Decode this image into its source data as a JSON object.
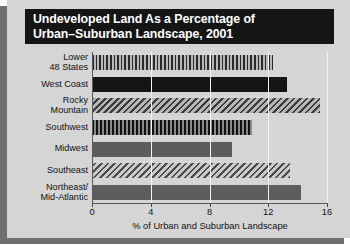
{
  "chart_data": {
    "type": "bar",
    "orientation": "horizontal",
    "title": "Undeveloped Land As a Percentage of Urban–Suburban Landscape, 2001",
    "title_lines": [
      "Undeveloped Land As a Percentage of",
      "Urban–Suburban Landscape, 2001"
    ],
    "categories": [
      "Lower\n48 States",
      "West Coast",
      "Rocky\nMountain",
      "Southwest",
      "Midwest",
      "Southeast",
      "Northeast/\nMid-Atlantic"
    ],
    "values": [
      12.3,
      13.3,
      15.5,
      10.9,
      9.5,
      13.5,
      14.2
    ],
    "xlabel": "% of Urban and Suburban Landscape",
    "ylabel": "",
    "xlim": [
      0,
      16
    ],
    "xticks": [
      0,
      4,
      8,
      12,
      16
    ],
    "xtick_labels": [
      "0",
      "4",
      "8",
      "12",
      "16"
    ],
    "grid": true,
    "grid_axis": "x",
    "legend": false,
    "bar_styles": [
      "vertical-stripe",
      "solid-black",
      "diagonal-stripe",
      "vertical-stripe-dark",
      "solid-gray",
      "diagonal-stripe-light",
      "solid-gray"
    ]
  },
  "colors": {
    "panel_background": "#d5d5d5",
    "title_background": "#151515",
    "title_text": "#ffffff",
    "gridline": "#f4f4f4",
    "axis": "#5a5a5a",
    "bar_black": "#151515",
    "bar_gray": "#5d5d5d",
    "shadow": "#6f6f6f"
  }
}
